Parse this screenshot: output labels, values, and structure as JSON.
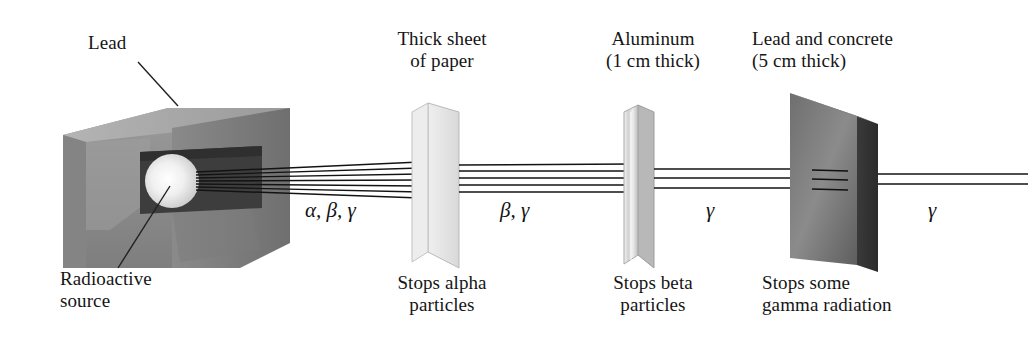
{
  "diagram": {
    "background": "#ffffff",
    "ink": "#151515"
  },
  "source": {
    "lead_label": "Lead",
    "source_label": "Radioactive\nsource",
    "lead_color": "#8e8e8e",
    "lead_top_color": "#a9a9a9",
    "lead_cavity_color": "#3f3f3f",
    "sphere_color": "#f2f2f2"
  },
  "barriers": [
    {
      "name": "paper",
      "top_label": "Thick sheet\nof paper",
      "bottom_label": "Stops alpha\nparticles",
      "color": "#e2e2e2"
    },
    {
      "name": "aluminum",
      "top_label": "Aluminum\n(1 cm thick)",
      "bottom_label": "Stops beta\nparticles",
      "color": "#cfcfcf"
    },
    {
      "name": "lead-and-concrete",
      "top_label": "Lead and concrete\n(5 cm thick)",
      "bottom_label": "Stops some\ngamma radiation",
      "color": "#6a6a6a"
    }
  ],
  "beam_labels": [
    {
      "name": "segment-1",
      "text": "α, β, γ"
    },
    {
      "name": "segment-2",
      "text": "β, γ"
    },
    {
      "name": "segment-3",
      "text": "γ"
    },
    {
      "name": "segment-4",
      "text": "γ"
    }
  ],
  "beam_ray_counts": {
    "after_source": 7,
    "after_paper": 5,
    "after_aluminum": 3,
    "after_lead_concrete": 2
  }
}
